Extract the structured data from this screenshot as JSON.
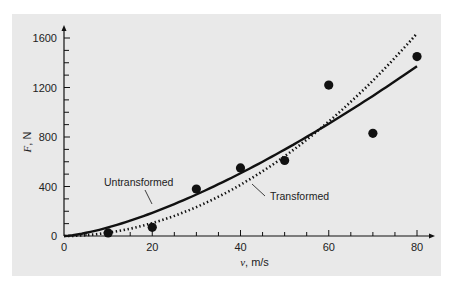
{
  "chart_data": {
    "type": "scatter",
    "title": "",
    "xlabel": "v, m/s",
    "ylabel": "F, N",
    "xlim": [
      0,
      80
    ],
    "ylim": [
      0,
      1600
    ],
    "x_ticks": [
      0,
      20,
      40,
      60,
      80
    ],
    "y_ticks": [
      0,
      400,
      800,
      1200,
      1600
    ],
    "grid": false,
    "legend": "none (inline annotations)",
    "series": [
      {
        "name": "Data",
        "style": "filled circles",
        "x": [
          10,
          20,
          30,
          40,
          50,
          60,
          70,
          80
        ],
        "y": [
          25,
          70,
          380,
          550,
          610,
          1220,
          830,
          1450
        ]
      },
      {
        "name": "Untransformed",
        "style": "solid line",
        "model": "F = 2.5384 v^1.4359",
        "x": [
          0,
          10,
          20,
          30,
          40,
          50,
          60,
          70,
          80
        ],
        "y": [
          0,
          69,
          187,
          334,
          505,
          697,
          906,
          1132,
          1372
        ]
      },
      {
        "name": "Transformed",
        "style": "dotted line",
        "model": "F = 0.2741 v^1.9842",
        "x": [
          0,
          10,
          20,
          30,
          40,
          50,
          60,
          70,
          80
        ],
        "y": [
          0,
          26,
          104,
          233,
          413,
          644,
          926,
          1259,
          1643
        ]
      }
    ],
    "annotations": [
      {
        "text": "Untransformed",
        "points_to": "solid line near v≈27"
      },
      {
        "text": "Transformed",
        "points_to": "dotted line near v≈44"
      }
    ]
  },
  "labels": {
    "x_axis": "v, m/s",
    "y_axis": "F, N",
    "untransformed": "Untransformed",
    "transformed": "Transformed",
    "x_ticks": [
      "0",
      "20",
      "40",
      "60",
      "80"
    ],
    "y_ticks": [
      "0",
      "400",
      "800",
      "1200",
      "1600"
    ]
  },
  "colors": {
    "panel": "#e9e9e9",
    "ink": "#111111"
  }
}
